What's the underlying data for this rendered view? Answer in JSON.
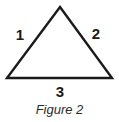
{
  "figure": {
    "caption": "Figure 2",
    "background_color": "#ffffff",
    "stroke_color": "#1a1a1a",
    "label_color": "#1a1a1a"
  },
  "diagram": {
    "shape": "triangle",
    "shape_name": "triangle-outline",
    "vertices": {
      "apex": {
        "x": 60,
        "y": 7
      },
      "bottom_left": {
        "x": 7,
        "y": 78
      },
      "bottom_right": {
        "x": 112,
        "y": 78
      }
    },
    "stroke_width": 2.4,
    "side_labels": [
      {
        "id": "left-side",
        "text": "1"
      },
      {
        "id": "right-side",
        "text": "2"
      },
      {
        "id": "base-side",
        "text": "3"
      }
    ]
  }
}
